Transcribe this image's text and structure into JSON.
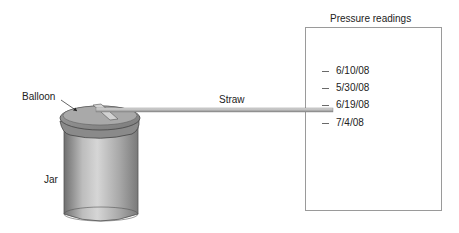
{
  "labels": {
    "balloon": "Balloon",
    "jar": "Jar",
    "straw": "Straw",
    "panel_title": "Pressure readings"
  },
  "readings": [
    "6/10/08",
    "5/30/08",
    "6/19/08",
    "7/4/08"
  ]
}
